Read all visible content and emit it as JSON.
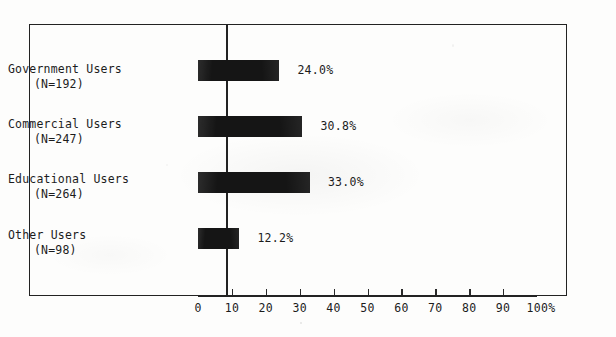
{
  "chart_data": {
    "type": "bar",
    "orientation": "horizontal",
    "title": "",
    "xlabel": "",
    "ylabel": "",
    "xlim": [
      0,
      100
    ],
    "xticks": [
      "0",
      "10",
      "20",
      "30",
      "40",
      "50",
      "60",
      "70",
      "80",
      "90",
      "100%"
    ],
    "xtick_values": [
      0,
      10,
      20,
      30,
      40,
      50,
      60,
      70,
      80,
      90,
      100
    ],
    "grid": false,
    "legend": "none",
    "bar_color": "#151515",
    "frame_color": "#222222",
    "categories": [
      "Government Users",
      "Commercial Users",
      "Educational Users",
      "Other Users"
    ],
    "values": [
      24.0,
      30.8,
      33.0,
      12.2
    ],
    "data_labels": [
      "24.0%",
      "30.8%",
      "33.0%",
      "12.2%"
    ],
    "counts": [
      192,
      247,
      264,
      98
    ],
    "count_labels": [
      "(N=192)",
      "(N=247)",
      "(N=264)",
      "(N=98)"
    ],
    "rows": [
      {
        "category": "Government Users",
        "count_label": "(N=192)",
        "value": 24.0,
        "value_label": "24.0%"
      },
      {
        "category": "Commercial Users",
        "count_label": "(N=247)",
        "value": 30.8,
        "value_label": "30.8%"
      },
      {
        "category": "Educational Users",
        "count_label": "(N=264)",
        "value": 33.0,
        "value_label": "33.0%"
      },
      {
        "category": "Other Users",
        "count_label": "(N=98)",
        "value": 12.2,
        "value_label": "12.2%"
      }
    ]
  }
}
